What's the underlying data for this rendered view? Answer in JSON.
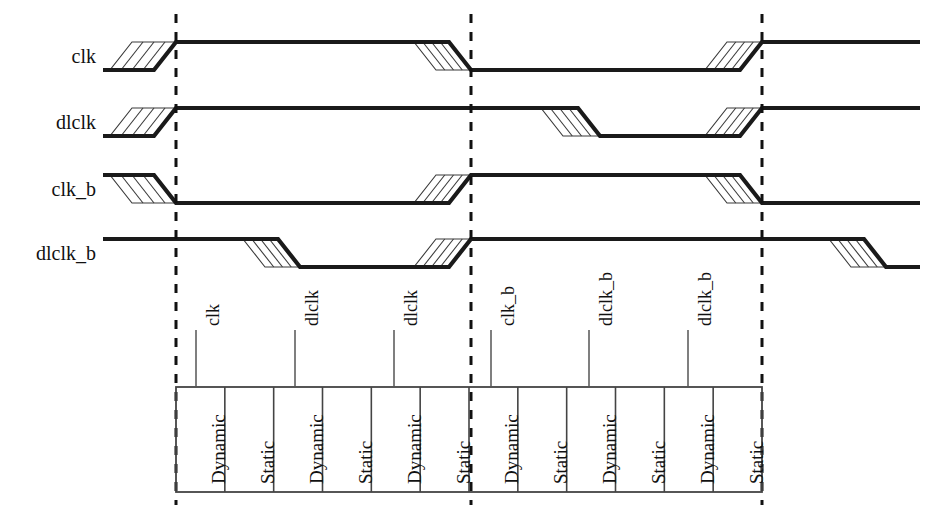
{
  "figure": {
    "kind": "timing-diagram",
    "background_color": "#ffffff",
    "line_color": "#1a1a1a",
    "hatch_color": "#3a3a3a",
    "dashed_color": "#111111",
    "table_border_color": "#444444"
  },
  "signals": [
    {
      "name": "clk",
      "label": "clk"
    },
    {
      "name": "dlclk",
      "label": "dlclk"
    },
    {
      "name": "clk_b",
      "label": "clk_b"
    },
    {
      "name": "dlclk_b",
      "label": "dlclk_b"
    }
  ],
  "markers": [
    {
      "name": "edge-marker-1",
      "x": 176
    },
    {
      "name": "edge-marker-2",
      "x": 471
    },
    {
      "name": "edge-marker-3",
      "x": 762
    }
  ],
  "leaders": [
    {
      "label": "clk",
      "x": 196
    },
    {
      "label": "dlclk",
      "x": 295
    },
    {
      "label": "dlclk",
      "x": 394
    },
    {
      "label": "clk_b",
      "x": 491
    },
    {
      "label": "dlclk_b",
      "x": 589
    },
    {
      "label": "dlclk_b",
      "x": 688
    }
  ],
  "table": {
    "left": 176,
    "right": 762,
    "top": 387,
    "bottom": 492,
    "cells": [
      {
        "label": "Dynamic"
      },
      {
        "label": "Static"
      },
      {
        "label": "Dynamic"
      },
      {
        "label": "Static"
      },
      {
        "label": "Dynamic"
      },
      {
        "label": "Static"
      },
      {
        "label": "Dynamic"
      },
      {
        "label": "Static"
      },
      {
        "label": "Dynamic"
      },
      {
        "label": "Static"
      },
      {
        "label": "Dynamic"
      },
      {
        "label": "Static"
      }
    ]
  },
  "chart_data": {
    "type": "line",
    "title": "",
    "xlabel": "",
    "ylabel": "",
    "x_markers": [
      176,
      471,
      762
    ],
    "series": [
      {
        "name": "clk",
        "high_y": 42,
        "low_y": 70,
        "start_level": "low",
        "transitions": [
          {
            "at": 176,
            "from": "low",
            "to": "high",
            "hatch_start": 110
          },
          {
            "at": 471,
            "from": "high",
            "to": "low",
            "hatch_start": 414
          },
          {
            "at": 762,
            "from": "low",
            "to": "high",
            "hatch_start": 705
          }
        ]
      },
      {
        "name": "dlclk",
        "high_y": 108,
        "low_y": 136,
        "start_level": "low",
        "transitions": [
          {
            "at": 176,
            "from": "low",
            "to": "high",
            "hatch_start": 110
          },
          {
            "at": 600,
            "from": "high",
            "to": "low",
            "hatch_start": 541
          },
          {
            "at": 762,
            "from": "low",
            "to": "high",
            "hatch_start": 705
          }
        ]
      },
      {
        "name": "clk_b",
        "high_y": 175,
        "low_y": 203,
        "start_level": "high",
        "transitions": [
          {
            "at": 176,
            "from": "high",
            "to": "low",
            "hatch_start": 110
          },
          {
            "at": 471,
            "from": "low",
            "to": "high",
            "hatch_start": 414
          },
          {
            "at": 762,
            "from": "high",
            "to": "low",
            "hatch_start": 705
          }
        ]
      },
      {
        "name": "dlclk_b",
        "high_y": 239,
        "low_y": 267,
        "start_level": "high",
        "transitions": [
          {
            "at": 300,
            "from": "high",
            "to": "low",
            "hatch_start": 243
          },
          {
            "at": 471,
            "from": "low",
            "to": "high",
            "hatch_start": 414
          },
          {
            "at": 886,
            "from": "high",
            "to": "low",
            "hatch_start": 829
          }
        ]
      }
    ]
  }
}
